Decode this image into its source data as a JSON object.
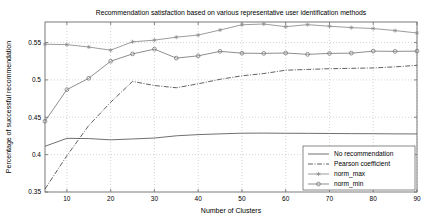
{
  "chart_data": {
    "type": "line",
    "title": "Recommendation satisfaction based on various representative user identification methods",
    "xlabel": "Number of Clusters",
    "ylabel": "Percentage of successful recommendation",
    "xlim": [
      5,
      90
    ],
    "ylim": [
      0.35,
      0.5775
    ],
    "xticks": [
      10,
      20,
      30,
      40,
      50,
      60,
      70,
      80,
      90
    ],
    "xtick_labels": [
      "10",
      "20",
      "30",
      "40",
      "50",
      "60",
      "70",
      "80",
      "90"
    ],
    "yticks": [
      0.35,
      0.4,
      0.45,
      0.5,
      0.55
    ],
    "ytick_labels": [
      "0.35",
      "0.4",
      "0.45",
      "0.5",
      "0.55"
    ],
    "grid": true,
    "legend_position": "lower right",
    "x": [
      5,
      10,
      15,
      20,
      25,
      30,
      35,
      40,
      45,
      50,
      55,
      60,
      65,
      70,
      75,
      80,
      85,
      90
    ],
    "series": [
      {
        "name": "No recommendation",
        "style": "solid",
        "marker": "none",
        "color": "#555555",
        "values": [
          0.4112,
          0.4218,
          0.4215,
          0.4198,
          0.421,
          0.4222,
          0.4252,
          0.4268,
          0.4278,
          0.4287,
          0.4288,
          0.4286,
          0.4285,
          0.4283,
          0.4281,
          0.428,
          0.4278,
          0.4277
        ]
      },
      {
        "name": "Pearson coefficient",
        "style": "dashdot",
        "marker": "none",
        "color": "#444444",
        "values": [
          0.354,
          0.3985,
          0.439,
          0.47,
          0.498,
          0.4925,
          0.4895,
          0.4948,
          0.5008,
          0.5055,
          0.5085,
          0.513,
          0.514,
          0.515,
          0.5155,
          0.516,
          0.5175,
          0.5195
        ]
      },
      {
        "name": "norm_max",
        "style": "solid",
        "marker": "star",
        "color": "#8a8a8a",
        "values": [
          0.5478,
          0.5472,
          0.544,
          0.5398,
          0.551,
          0.5532,
          0.5572,
          0.56,
          0.5668,
          0.5738,
          0.5748,
          0.5712,
          0.574,
          0.5718,
          0.57,
          0.5688,
          0.566,
          0.5628
        ]
      },
      {
        "name": "norm_min",
        "style": "solid",
        "marker": "circle",
        "color": "#7a7a7a",
        "values": [
          0.4448,
          0.487,
          0.5022,
          0.525,
          0.5348,
          0.5412,
          0.5292,
          0.5322,
          0.5382,
          0.5358,
          0.5355,
          0.536,
          0.5342,
          0.5355,
          0.5358,
          0.5385,
          0.5382,
          0.5385
        ]
      }
    ]
  },
  "figure": {
    "plot_left": 45,
    "plot_right": 417,
    "plot_top": 22,
    "plot_bottom": 192,
    "axis_color": "#6b6b6b",
    "grid_color": "#b9b9b9",
    "background": "#ffffff"
  },
  "legend": {
    "items": [
      {
        "label": "No recommendation"
      },
      {
        "label": "Pearson coefficient"
      },
      {
        "label": "norm_max"
      },
      {
        "label": "norm_min"
      }
    ]
  }
}
